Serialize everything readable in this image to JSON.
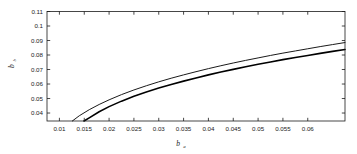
{
  "chart_data": {
    "type": "line",
    "title": "",
    "xlabel": "b_a",
    "xlabel_base": "b",
    "xlabel_sub": "a",
    "ylabel": "b_b",
    "ylabel_base": "b",
    "ylabel_sub": "b",
    "xlim": [
      0.0075,
      0.0675
    ],
    "ylim": [
      0.0345,
      0.11
    ],
    "xticks": [
      0.01,
      0.015,
      0.02,
      0.025,
      0.03,
      0.035,
      0.04,
      0.045,
      0.05,
      0.055,
      0.06
    ],
    "xticklabels": [
      "0.01",
      "0.015",
      "0.02",
      "0.025",
      "0.03",
      "0.035",
      "0.04",
      "0.045",
      "0.05",
      "0.055",
      "0.06"
    ],
    "yticks": [
      0.04,
      0.05,
      0.06,
      0.07,
      0.08,
      0.09,
      0.1,
      0.11
    ],
    "yticklabels": [
      "0.04",
      "0.05",
      "0.06",
      "0.07",
      "0.08",
      "0.09",
      "0.1",
      "0.11"
    ],
    "grid": false,
    "legend": null,
    "box": true,
    "series": [
      {
        "name": "upper-curve",
        "color": "#1a1a1a",
        "linewidth": 1.0,
        "x": [
          0.0126,
          0.014,
          0.016,
          0.018,
          0.02,
          0.0225,
          0.025,
          0.0275,
          0.03,
          0.0325,
          0.035,
          0.0375,
          0.04,
          0.0425,
          0.045,
          0.0475,
          0.05,
          0.0525,
          0.055,
          0.0575,
          0.06,
          0.0625,
          0.065,
          0.0675
        ],
        "y": [
          0.0345,
          0.0381,
          0.0423,
          0.0459,
          0.0491,
          0.0527,
          0.0559,
          0.0588,
          0.0615,
          0.064,
          0.0663,
          0.0685,
          0.0706,
          0.0726,
          0.0745,
          0.0763,
          0.078,
          0.0797,
          0.0813,
          0.0828,
          0.0843,
          0.0858,
          0.0872,
          0.0886
        ]
      },
      {
        "name": "lower-curve",
        "color": "#000000",
        "linewidth": 1.6,
        "x": [
          0.01495,
          0.016,
          0.018,
          0.02,
          0.0225,
          0.025,
          0.0275,
          0.03,
          0.0325,
          0.035,
          0.0375,
          0.04,
          0.0425,
          0.045,
          0.0475,
          0.05,
          0.0525,
          0.055,
          0.0575,
          0.06,
          0.0625,
          0.065,
          0.0675
        ],
        "y": [
          0.0345,
          0.0367,
          0.0409,
          0.0444,
          0.0482,
          0.0515,
          0.0545,
          0.0572,
          0.0597,
          0.062,
          0.0642,
          0.0663,
          0.0683,
          0.0701,
          0.0719,
          0.0736,
          0.0752,
          0.0768,
          0.0783,
          0.0797,
          0.0811,
          0.0825,
          0.0838
        ]
      }
    ]
  }
}
